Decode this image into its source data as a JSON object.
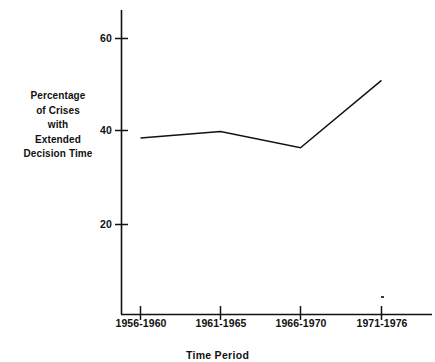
{
  "chart_data": {
    "type": "line",
    "title": "",
    "subtitle": "",
    "xlabel": "Time Period",
    "ylabel": "Percentage of Crises with Extended Decision Time",
    "ylabel_lines": [
      "Percentage",
      "of Crises",
      "with",
      "Extended",
      "Decision Time"
    ],
    "categories": [
      "1956-1960",
      "1961-1965",
      "1966-1970",
      "1971-1976"
    ],
    "values": [
      38.6,
      40.0,
      36.5,
      51.0
    ],
    "series": [
      {
        "name": "Percentage of Crises with Extended Decision Time",
        "values": [
          38.6,
          40.0,
          36.5,
          51.0
        ]
      }
    ],
    "ylim": [
      0,
      65
    ],
    "ytick_labels": [
      "60",
      "40",
      "20"
    ],
    "ytick_values": [
      60,
      40,
      20
    ],
    "grid": false,
    "legend": "none",
    "line_color": "#111111",
    "axis_color": "#111111",
    "background_color": "#ffffff",
    "markers": false,
    "annotations": []
  },
  "axes": {
    "y_ticks": [
      {
        "label": "60",
        "value": 60
      },
      {
        "label": "40",
        "value": 40
      },
      {
        "label": "20",
        "value": 20
      }
    ],
    "x_ticks": [
      {
        "label": "1956-1960"
      },
      {
        "label": "1961-1965"
      },
      {
        "label": "1966-1970"
      },
      {
        "label": "1971-1976"
      }
    ]
  }
}
